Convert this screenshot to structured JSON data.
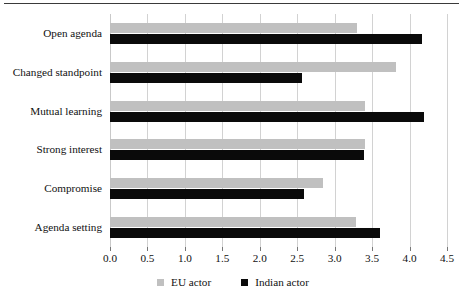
{
  "chart_data": {
    "type": "bar",
    "orientation": "horizontal",
    "title": "",
    "xlabel": "",
    "ylabel": "",
    "xlim": [
      0.0,
      4.5
    ],
    "grid": true,
    "legend_position": "bottom",
    "categories": [
      "Open agenda",
      "Changed standpoint",
      "Mutual learning",
      "Strong interest",
      "Compromise",
      "Agenda setting"
    ],
    "series": [
      {
        "name": "EU actor",
        "color": "#c0c0c0",
        "values": [
          3.3,
          3.82,
          3.41,
          3.4,
          2.84,
          3.28
        ]
      },
      {
        "name": "Indian actor",
        "color": "#0a0a0a",
        "values": [
          4.17,
          2.57,
          4.19,
          3.39,
          2.59,
          3.61
        ]
      }
    ],
    "xticks": [
      0.0,
      0.5,
      1.0,
      1.5,
      2.0,
      2.5,
      3.0,
      3.5,
      4.0,
      4.5
    ],
    "xticklabels": [
      "0.0",
      "0.5",
      "1.0",
      "1.5",
      "2.0",
      "2.5",
      "3.0",
      "3.5",
      "4.0",
      "4.5"
    ]
  },
  "legend": {
    "items": [
      {
        "label": "EU actor",
        "color": "#c0c0c0"
      },
      {
        "label": "Indian actor",
        "color": "#0a0a0a"
      }
    ]
  }
}
